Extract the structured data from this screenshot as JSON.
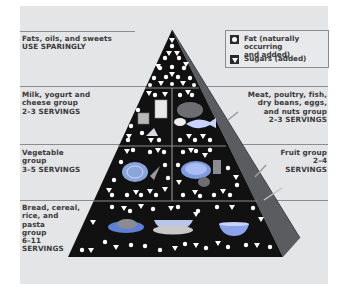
{
  "legend": [
    {
      "icon": "fat-circle-icon",
      "label": "Fat (naturally occurring\nand added)"
    },
    {
      "icon": "sugar-triangle-icon",
      "label": "Sugars (added)"
    }
  ],
  "groups": {
    "top": {
      "label": "Fats, oils, and sweets\nUSE SPARINGLY"
    },
    "milk": {
      "label": "Milk, yogurt and\ncheese group\n2–3 SERVINGS"
    },
    "meat": {
      "label": "Meat, poultry, fish,\ndry beans, eggs,\nand nuts group\n2–3 SERVINGS"
    },
    "vegetable": {
      "label": "Vegetable\ngroup\n3–5 SERVINGS"
    },
    "fruit": {
      "label": "Fruit group\n2–4\nSERVINGS"
    },
    "bread": {
      "label": "Bread, cereal,\nrice, and\npasta\ngroup\n6–11\nSERVINGS"
    }
  },
  "colors": {
    "panel": "#e4e5e7",
    "pyramid": "#111111",
    "side_face": "#5a5c60",
    "text": "#3a3a3a",
    "food_blue": "#7f9be0"
  }
}
